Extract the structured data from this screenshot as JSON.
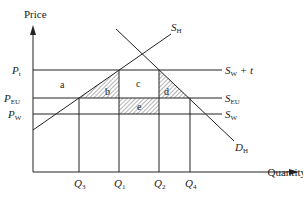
{
  "axes": {
    "y_label": "Price",
    "x_label": "Quantity"
  },
  "price_levels": [
    {
      "id": "Pt",
      "label": "P",
      "sub": "t",
      "y": 70
    },
    {
      "id": "PEU",
      "label": "P",
      "sub": "EU",
      "y": 98
    },
    {
      "id": "PW",
      "label": "P",
      "sub": "W",
      "y": 114
    }
  ],
  "quantity_levels": [
    {
      "id": "Q3",
      "label": "Q",
      "sub": "3",
      "x": 79
    },
    {
      "id": "Q1",
      "label": "Q",
      "sub": "1",
      "x": 119
    },
    {
      "id": "Q2",
      "label": "Q",
      "sub": "2",
      "x": 159
    },
    {
      "id": "Q4",
      "label": "Q",
      "sub": "4",
      "x": 190
    }
  ],
  "curves": {
    "SH": {
      "label": "S",
      "sub": "H"
    },
    "DH": {
      "label": "D",
      "sub": "H"
    },
    "SWt": {
      "label": "S",
      "sub": "W",
      "suffix": " + t"
    },
    "SEU": {
      "label": "S",
      "sub": "EU"
    },
    "SW": {
      "label": "S",
      "sub": "W"
    }
  },
  "areas": {
    "a": "a",
    "b": "b",
    "c": "c",
    "d": "d",
    "e": "e"
  },
  "colors": {
    "line": "#222222",
    "hatch": "#444444",
    "background": "#ffffff"
  }
}
